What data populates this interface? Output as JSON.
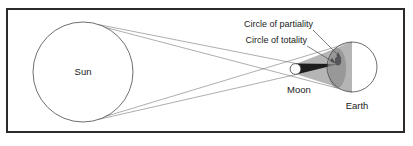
{
  "figure": {
    "type": "solar-eclipse-geometry-diagram",
    "title": "",
    "frame": {
      "border_color": "#2b2b2b",
      "border_width": 2,
      "background": "#ffffff",
      "x": 6,
      "y": 8,
      "width": 399,
      "height": 125
    },
    "labels": {
      "sun": "Sun",
      "moon": "Moon",
      "earth": "Earth",
      "circle_of_partiality": "Circle of partiality",
      "circle_of_totality": "Circle of totality"
    },
    "bodies": [
      {
        "name": "sun",
        "label": "Sun",
        "shape": "circle",
        "cx": 83,
        "cy": 72,
        "r": 50,
        "fill": "#ffffff",
        "stroke": "#4a4a4a",
        "stroke_width": 0.8,
        "label_x": 83,
        "label_y": 75
      },
      {
        "name": "moon",
        "label": "Moon",
        "shape": "circle",
        "cx": 296,
        "cy": 69,
        "r": 5.5,
        "fill": "#ffffff",
        "stroke": "#3a3a3a",
        "stroke_width": 0.8,
        "label_x": 299,
        "label_y": 92
      },
      {
        "name": "earth",
        "label": "Earth",
        "shape": "circle",
        "cx": 352,
        "cy": 67,
        "r": 25,
        "fill": "#ffffff",
        "stroke": "#4a4a4a",
        "stroke_width": 0.8,
        "label_x": 356,
        "label_y": 108
      }
    ],
    "shadow": {
      "umbra_color": "#1c1c1c",
      "penumbra_color": "#9a9a9a",
      "penumbra_opacity": 0.72,
      "umbra_spot_color": "#55555a",
      "umbra_spot": {
        "cx": 338,
        "cy": 61,
        "rx": 3.4,
        "ry": 4.6
      },
      "penumbra_patch": {
        "cx": 336,
        "cy": 68,
        "rx": 9,
        "ry": 20
      }
    },
    "rays": {
      "color": "#6b6b6b",
      "width": 0.55,
      "description": "tangent light rays from Sun limbs past the Moon onto Earth"
    },
    "callouts": [
      {
        "name": "circle-of-partiality",
        "text": "Circle of partiality",
        "text_x": 313,
        "text_y": 27,
        "anchor": "end",
        "leader": {
          "x1": 310,
          "y1": 30,
          "x2": 340,
          "y2": 57
        }
      },
      {
        "name": "circle-of-totality",
        "text": "Circle of totality",
        "text_x": 310,
        "text_y": 43,
        "anchor": "end",
        "leader": {
          "x1": 307,
          "y1": 46,
          "x2": 334,
          "y2": 62
        }
      }
    ]
  }
}
